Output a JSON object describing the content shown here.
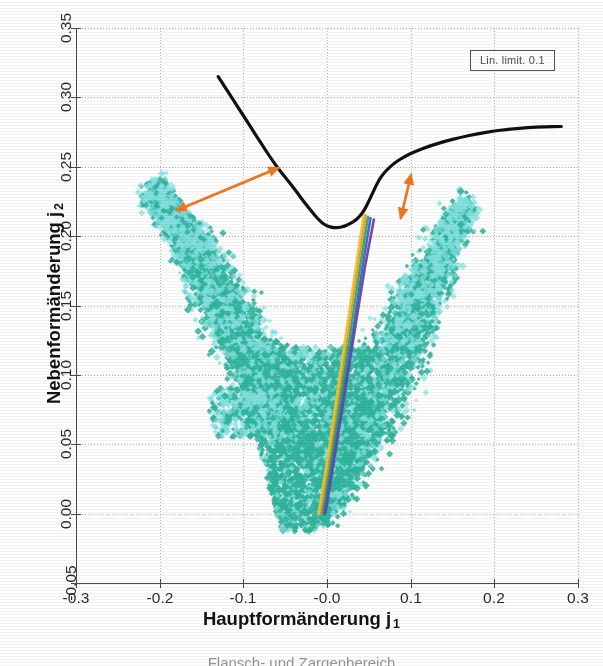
{
  "figure": {
    "kind": "forming-limit-diagram",
    "caption_partial": "Flansch- und Zargenbereich",
    "background": "#ffffff"
  },
  "legend": {
    "text": "Lin. limit. 0.1"
  },
  "axes": {
    "x": {
      "title": "Hauptformänderung j",
      "subscript": "1",
      "min": -0.3,
      "max": 0.3,
      "tick_step": 0.1,
      "ticks": [
        -0.3,
        -0.2,
        -0.1,
        -0.0,
        0.1,
        0.2,
        0.3
      ],
      "tick_labels": [
        "-0.3",
        "-0.2",
        "-0.1",
        "-0.0",
        "0.1",
        "0.2",
        "0.3"
      ]
    },
    "y": {
      "title": "Nebenformänderung j",
      "subscript": "2",
      "min": -0.05,
      "max": 0.35,
      "tick_step": 0.05,
      "ticks": [
        -0.05,
        0.0,
        0.05,
        0.1,
        0.15,
        0.2,
        0.25,
        0.3,
        0.35
      ],
      "tick_labels": [
        "-0.05",
        "0.00",
        "0.05",
        "0.10",
        "0.15",
        "0.20",
        "0.25",
        "0.30",
        "0.35"
      ]
    },
    "grid": true,
    "grid_style": "dotted"
  },
  "colors": {
    "flc_curve": "#101010",
    "scatter_dark": "#2bb39b",
    "scatter_light": "#7fe0e0",
    "arrow": "#ef7722",
    "grid": "#9a9a9a",
    "axis": "#4a4a4a",
    "path_purple": "#6b3fa0",
    "path_blue": "#3b5fc0",
    "path_green": "#2fa36b",
    "path_orange": "#e8902a",
    "path_yellow": "#e8c832"
  },
  "chart_data": {
    "type": "scatter",
    "title": "",
    "xlabel": "Hauptformänderung j1",
    "ylabel": "Nebenformänderung j2",
    "xlim": [
      -0.3,
      0.3
    ],
    "ylim": [
      -0.05,
      0.35
    ],
    "grid": true,
    "legend_position": "top-right",
    "series": [
      {
        "name": "Forming limit curve (FLC)",
        "type": "line",
        "color": "#101010",
        "linewidth": 3.2,
        "points": [
          [
            -0.13,
            0.315
          ],
          [
            -0.122,
            0.3075
          ],
          [
            -0.114,
            0.3
          ],
          [
            -0.106,
            0.2925
          ],
          [
            -0.098,
            0.285
          ],
          [
            -0.09,
            0.2775
          ],
          [
            -0.082,
            0.27
          ],
          [
            -0.074,
            0.2625
          ],
          [
            -0.066,
            0.2552
          ],
          [
            -0.058,
            0.2485
          ],
          [
            -0.052,
            0.244
          ],
          [
            -0.046,
            0.2395
          ],
          [
            -0.04,
            0.235
          ],
          [
            -0.034,
            0.23
          ],
          [
            -0.028,
            0.225
          ],
          [
            -0.022,
            0.2205
          ],
          [
            -0.016,
            0.216
          ],
          [
            -0.01,
            0.212
          ],
          [
            -0.004,
            0.2085
          ],
          [
            0.002,
            0.207
          ],
          [
            0.008,
            0.206
          ],
          [
            0.014,
            0.2062
          ],
          [
            0.02,
            0.207
          ],
          [
            0.026,
            0.2085
          ],
          [
            0.032,
            0.2105
          ],
          [
            0.038,
            0.2135
          ],
          [
            0.044,
            0.218
          ],
          [
            0.05,
            0.225
          ],
          [
            0.056,
            0.233
          ],
          [
            0.062,
            0.2405
          ],
          [
            0.07,
            0.247
          ],
          [
            0.08,
            0.2525
          ],
          [
            0.092,
            0.2572
          ],
          [
            0.106,
            0.2612
          ],
          [
            0.122,
            0.2648
          ],
          [
            0.14,
            0.2682
          ],
          [
            0.16,
            0.2712
          ],
          [
            0.18,
            0.2738
          ],
          [
            0.2,
            0.2758
          ],
          [
            0.22,
            0.2772
          ],
          [
            0.24,
            0.2782
          ],
          [
            0.26,
            0.2788
          ],
          [
            0.28,
            0.279
          ]
        ]
      },
      {
        "name": "Messpunkte (Flanschbereich)",
        "type": "scatter",
        "marker": "diamond",
        "color": "#2bb39b",
        "edge_color": "#7fe0e0",
        "n_points_approx": 9000,
        "description": "V-shaped point cloud; left branch rises from (-0.01,0.03) to (-0.205,0.235); right branch rises from (-0.005,-0.005) to (0.16,0.215)",
        "branches": [
          {
            "name": "left-branch",
            "start": [
              -0.01,
              0.03
            ],
            "end": [
              -0.205,
              0.235
            ],
            "half_width": 0.022
          },
          {
            "name": "right-branch",
            "start": [
              -0.004,
              -0.005
            ],
            "end": [
              0.158,
              0.215
            ],
            "half_width": 0.026
          },
          {
            "name": "lower-bulk",
            "x_range": [
              -0.115,
              0.055
            ],
            "y_range": [
              -0.013,
              0.12
            ]
          }
        ]
      },
      {
        "name": "Dehnungspfad violett",
        "type": "line",
        "color": "#6b3fa0",
        "points": [
          [
            -0.002,
            0.0
          ],
          [
            0.01,
            0.045
          ],
          [
            0.022,
            0.09
          ],
          [
            0.034,
            0.135
          ],
          [
            0.046,
            0.18
          ],
          [
            0.056,
            0.212
          ]
        ]
      },
      {
        "name": "Dehnungspfad blau",
        "type": "line",
        "color": "#3b5fc0",
        "points": [
          [
            -0.004,
            0.0
          ],
          [
            0.008,
            0.045
          ],
          [
            0.02,
            0.09
          ],
          [
            0.032,
            0.135
          ],
          [
            0.043,
            0.18
          ],
          [
            0.052,
            0.213
          ]
        ]
      },
      {
        "name": "Dehnungspfad grün",
        "type": "line",
        "color": "#2fa36b",
        "points": [
          [
            -0.006,
            0.0
          ],
          [
            0.006,
            0.045
          ],
          [
            0.018,
            0.09
          ],
          [
            0.029,
            0.135
          ],
          [
            0.04,
            0.18
          ],
          [
            0.049,
            0.214
          ]
        ]
      },
      {
        "name": "Dehnungspfad orange",
        "type": "line",
        "color": "#e8902a",
        "points": [
          [
            -0.008,
            0.0
          ],
          [
            0.004,
            0.045
          ],
          [
            0.015,
            0.09
          ],
          [
            0.026,
            0.135
          ],
          [
            0.037,
            0.18
          ],
          [
            0.046,
            0.215
          ]
        ]
      },
      {
        "name": "Dehnungspfad gelb",
        "type": "line",
        "color": "#e8c832",
        "points": [
          [
            -0.01,
            0.0
          ],
          [
            0.002,
            0.045
          ],
          [
            0.013,
            0.09
          ],
          [
            0.024,
            0.135
          ],
          [
            0.035,
            0.18
          ],
          [
            0.044,
            0.2155
          ]
        ]
      }
    ],
    "annotations": [
      {
        "name": "arrow-long",
        "type": "double-arrow",
        "color": "#ef7722",
        "from": [
          -0.17,
          0.221
        ],
        "to": [
          -0.057,
          0.2495
        ]
      },
      {
        "name": "arrow-short",
        "type": "double-arrow",
        "color": "#ef7722",
        "from": [
          0.098,
          0.238
        ],
        "to": [
          0.088,
          0.2125
        ]
      }
    ]
  }
}
